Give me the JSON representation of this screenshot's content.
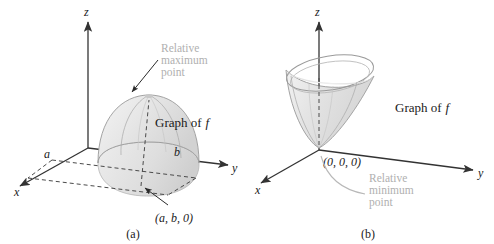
{
  "figure": {
    "panels": [
      {
        "id": "a",
        "caption": "(a)",
        "axes": {
          "x": "x",
          "y": "y",
          "z": "z"
        },
        "surface_label": "Graph of",
        "surface_label_var": "f",
        "tick_labels": {
          "x_tick": "a",
          "y_tick": "b"
        },
        "point_label": "(a, b, 0)",
        "callout": {
          "line1": "Relative",
          "line2": "maximum",
          "line3": "point"
        }
      },
      {
        "id": "b",
        "caption": "(b)",
        "axes": {
          "x": "x",
          "y": "y",
          "z": "z"
        },
        "surface_label": "Graph of",
        "surface_label_var": "f",
        "point_label": "(0, 0, 0)",
        "callout": {
          "line1": "Relative",
          "line2": "minimum",
          "line3": "point"
        }
      }
    ]
  },
  "colors": {
    "background": "#ffffff",
    "axis": "#333333",
    "dashed": "#4a4a4a",
    "text": "#1a1a1a",
    "callout_text": "#b0b0b0",
    "surface_outline": "#9a9a9a",
    "surface_fill": "#e8e8e8"
  }
}
